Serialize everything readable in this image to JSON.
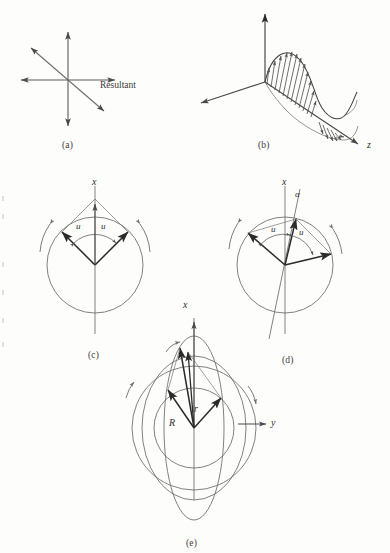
{
  "figure": {
    "panels": [
      {
        "id": "a",
        "caption": "(a)",
        "caption_x": 62,
        "caption_y": 140,
        "description": "four-arrow vector cross with labelled resultant"
      },
      {
        "id": "b",
        "caption": "(b)",
        "caption_x": 258,
        "caption_y": 140,
        "description": "transverse wave on three-dimensional axes"
      },
      {
        "id": "c",
        "caption": "(c)",
        "caption_x": 88,
        "caption_y": 350,
        "description": "two rotating vectors symmetric about the x axis"
      },
      {
        "id": "d",
        "caption": "(d)",
        "caption_x": 282,
        "caption_y": 355,
        "description": "three rotating vectors with tilted axis and angle alpha"
      },
      {
        "id": "e",
        "caption": "(e)",
        "caption_x": 186,
        "caption_y": 538,
        "description": "superposed circles and ellipses with radii R and r"
      }
    ],
    "labels": {
      "resultant": "Resultant",
      "axis_x": "x",
      "axis_y": "y",
      "axis_z": "z",
      "angle_u": "u",
      "angle_alpha": "α",
      "radius_R": "R",
      "radius_r": "r"
    },
    "label_positions": {
      "resultant": {
        "x": 100,
        "y": 86
      },
      "panel_c_x": {
        "x": 93,
        "y": 182
      },
      "panel_c_u_left": {
        "x": 78,
        "y": 227
      },
      "panel_c_u_right": {
        "x": 101,
        "y": 227
      },
      "panel_d_x": {
        "x": 283,
        "y": 182
      },
      "panel_d_alpha": {
        "x": 296,
        "y": 194
      },
      "panel_d_u_left": {
        "x": 274,
        "y": 230
      },
      "panel_d_u_right": {
        "x": 300,
        "y": 232
      },
      "panel_e_x": {
        "x": 184,
        "y": 303
      },
      "panel_e_y": {
        "x": 274,
        "y": 424
      },
      "panel_e_R": {
        "x": 170,
        "y": 424
      },
      "panel_e_r": {
        "x": 194,
        "y": 410
      }
    },
    "colors": {
      "background": "#fdfdfb",
      "ink_heavy": "#2b2b2b",
      "ink_light": "#6f6f6f",
      "ink_mid": "#4a4a4a"
    },
    "geometry": {
      "panel_a": {
        "origin": {
          "x": 68,
          "y": 80
        },
        "arrow_up": {
          "x": 68,
          "y": 30
        },
        "arrow_down": {
          "x": 68,
          "y": 128
        },
        "arrow_right": {
          "x": 117,
          "y": 80
        },
        "arrow_left": {
          "x": 19,
          "y": 80
        },
        "resultant_upleft": {
          "x": 29,
          "y": 46
        },
        "resultant_downright": {
          "x": 106,
          "y": 113
        }
      },
      "panel_b": {
        "origin": {
          "x": 265,
          "y": 82
        },
        "axis_vertical_tip": {
          "x": 265,
          "y": 12
        },
        "axis_left_tip": {
          "x": 200,
          "y": 104
        },
        "axis_z_tip": {
          "x": 360,
          "y": 145
        },
        "wave_amplitude": 34,
        "wave_cycles": 1.5
      },
      "panel_c": {
        "center": {
          "x": 95,
          "y": 265
        },
        "radius": 48,
        "vector_angle_deg": 45,
        "vector_count": 2
      },
      "panel_d": {
        "center": {
          "x": 285,
          "y": 265
        },
        "radius": 48,
        "tilt_deg": 12,
        "vector_count": 3
      },
      "panel_e": {
        "center": {
          "x": 194,
          "y": 428
        },
        "radius_outer": 62,
        "radius_inner": 40,
        "ellipse_tall_rx": 30,
        "ellipse_tall_ry": 92
      }
    }
  }
}
